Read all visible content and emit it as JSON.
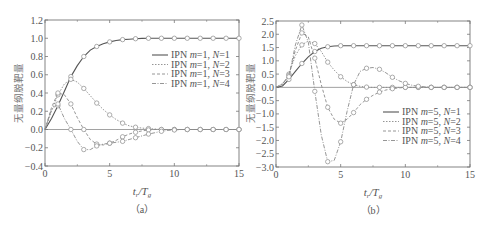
{
  "chart_data": [
    {
      "type": "line",
      "panel": "(a)",
      "caption": "（a）",
      "title": "",
      "xlabel": "t_r/T_g",
      "xlabel_main": "t",
      "xlabel_sub1": "r",
      "xlabel_main2": "/T",
      "xlabel_sub2": "g",
      "ylabel": "无量纲脱靶量",
      "xlim": [
        0,
        15
      ],
      "ylim": [
        -0.4,
        1.2
      ],
      "xticks": [
        0,
        5,
        10,
        15
      ],
      "yticks": [
        -0.4,
        -0.2,
        0.0,
        0.2,
        0.4,
        0.6,
        0.8,
        1.0,
        1.2
      ],
      "ytick_labels": [
        "−0.4",
        "−0.2",
        "0.0",
        "0.2",
        "0.4",
        "0.6",
        "0.8",
        "1.0",
        "1.2"
      ],
      "grid": false,
      "legend_position": "upper right",
      "x": [
        0,
        0.5,
        1,
        1.5,
        2,
        2.5,
        3,
        3.5,
        4,
        4.5,
        5,
        5.5,
        6,
        6.5,
        7,
        7.5,
        8,
        8.5,
        9,
        9.5,
        10,
        10.5,
        11,
        11.5,
        12,
        12.5,
        13,
        13.5,
        14,
        14.5,
        15
      ],
      "series": [
        {
          "name": "IPN m=1, N=1",
          "label_pre": "IPN",
          "m": "m",
          "m_val": "=1, ",
          "n": "N",
          "n_val": "=1",
          "style": "solid",
          "values": [
            0,
            0.12,
            0.26,
            0.42,
            0.58,
            0.7,
            0.8,
            0.87,
            0.91,
            0.94,
            0.96,
            0.975,
            0.985,
            0.99,
            0.995,
            0.998,
            1.0,
            1.0,
            1.0,
            1.0,
            1.0,
            1.0,
            1.0,
            1.0,
            1.0,
            1.0,
            1.0,
            1.0,
            1.0,
            1.0,
            1.0
          ]
        },
        {
          "name": "IPN m=1, N=2",
          "label_pre": "IPN",
          "m": "m",
          "m_val": "=1, ",
          "n": "N",
          "n_val": "=2",
          "style": "dotted",
          "values": [
            0,
            0.2,
            0.38,
            0.5,
            0.55,
            0.52,
            0.45,
            0.37,
            0.29,
            0.22,
            0.16,
            0.11,
            0.07,
            0.04,
            0.025,
            0.015,
            0.01,
            0.005,
            0.0,
            0.0,
            0.0,
            0.0,
            0.0,
            0.0,
            0.0,
            0.0,
            0.0,
            0.0,
            0.0,
            0.0,
            0.0
          ]
        },
        {
          "name": "IPN m=1, N=3",
          "label_pre": "IPN",
          "m": "m",
          "m_val": "=1, ",
          "n": "N",
          "n_val": "=3",
          "style": "dashed",
          "values": [
            0,
            0.24,
            0.4,
            0.38,
            0.28,
            0.13,
            0.0,
            -0.11,
            -0.16,
            -0.17,
            -0.15,
            -0.12,
            -0.08,
            -0.05,
            -0.03,
            -0.015,
            -0.005,
            0.0,
            0.0,
            0.0,
            0.0,
            0.0,
            0.0,
            0.0,
            0.0,
            0.0,
            0.0,
            0.0,
            0.0,
            0.0,
            0.0
          ]
        },
        {
          "name": "IPN m=1, N=4",
          "label_pre": "IPN",
          "m": "m",
          "m_val": "=1, ",
          "n": "N",
          "n_val": "=4",
          "style": "dashdot",
          "values": [
            0,
            0.22,
            0.28,
            0.12,
            0.0,
            -0.13,
            -0.22,
            -0.22,
            -0.18,
            -0.16,
            -0.15,
            -0.14,
            -0.13,
            -0.11,
            -0.09,
            -0.07,
            -0.05,
            -0.035,
            -0.02,
            -0.01,
            -0.005,
            0.0,
            0.0,
            0.0,
            0.0,
            0.0,
            0.0,
            0.0,
            0.0,
            0.0,
            0.0
          ]
        }
      ]
    },
    {
      "type": "line",
      "panel": "(b)",
      "caption": "（b）",
      "title": "",
      "xlabel": "t_r/T_g",
      "xlabel_main": "t",
      "xlabel_sub1": "r",
      "xlabel_main2": "/T",
      "xlabel_sub2": "g",
      "ylabel": "无量纲脱靶量",
      "xlim": [
        0,
        15
      ],
      "ylim": [
        -3.0,
        2.5
      ],
      "xticks": [
        0,
        5,
        10,
        15
      ],
      "yticks": [
        -3.0,
        -2.5,
        -2.0,
        -1.5,
        -1.0,
        -0.5,
        0.0,
        0.5,
        1.0,
        1.5,
        2.0,
        2.5
      ],
      "ytick_labels": [
        "−3.0",
        "−2.5",
        "−2.0",
        "−1.5",
        "−1.0",
        "−0.5",
        "0.0",
        "0.5",
        "1.0",
        "1.5",
        "2.0",
        "2.5"
      ],
      "grid": false,
      "legend_position": "lower right",
      "x": [
        0,
        0.5,
        1,
        1.5,
        2,
        2.5,
        3,
        3.5,
        4,
        4.5,
        5,
        5.5,
        6,
        6.5,
        7,
        7.5,
        8,
        8.5,
        9,
        9.5,
        10,
        10.5,
        11,
        11.5,
        12,
        12.5,
        13,
        13.5,
        14,
        14.5,
        15
      ],
      "series": [
        {
          "name": "IPN m=5, N=1",
          "label_pre": "IPN",
          "m": "m",
          "m_val": "=5, ",
          "n": "N",
          "n_val": "=1",
          "style": "solid",
          "values": [
            0,
            0.05,
            0.3,
            0.6,
            0.9,
            1.15,
            1.35,
            1.47,
            1.53,
            1.56,
            1.57,
            1.57,
            1.57,
            1.57,
            1.57,
            1.57,
            1.57,
            1.57,
            1.57,
            1.57,
            1.57,
            1.57,
            1.57,
            1.57,
            1.57,
            1.57,
            1.57,
            1.57,
            1.57,
            1.57,
            1.57
          ]
        },
        {
          "name": "IPN m=5, N=2",
          "label_pre": "IPN",
          "m": "m",
          "m_val": "=5, ",
          "n": "N",
          "n_val": "=2",
          "style": "dotted",
          "values": [
            0,
            0.1,
            0.5,
            1.2,
            1.6,
            1.75,
            1.65,
            1.35,
            0.95,
            0.65,
            0.4,
            0.22,
            0.1,
            0.04,
            0.01,
            0.0,
            0.0,
            0.0,
            0.0,
            0.0,
            0.0,
            0.0,
            0.0,
            0.0,
            0.0,
            0.0,
            0.0,
            0.0,
            0.0,
            0.0,
            0.0
          ]
        },
        {
          "name": "IPN m=5, N=3",
          "label_pre": "IPN",
          "m": "m",
          "m_val": "=5, ",
          "n": "N",
          "n_val": "=3",
          "style": "dashed",
          "values": [
            0,
            0.12,
            0.45,
            1.4,
            2.05,
            1.9,
            1.1,
            0.1,
            -0.75,
            -1.2,
            -1.35,
            -1.2,
            -0.95,
            -0.65,
            -0.45,
            -0.3,
            -0.18,
            -0.1,
            -0.05,
            -0.02,
            0.0,
            0.0,
            0.0,
            0.0,
            0.0,
            0.0,
            0.0,
            0.0,
            0.0,
            0.0,
            0.0
          ]
        },
        {
          "name": "IPN m=5, N=4",
          "label_pre": "IPN",
          "m": "m",
          "m_val": "=5, ",
          "n": "N",
          "n_val": "=4",
          "style": "dashdot",
          "values": [
            0,
            0.15,
            0.4,
            1.6,
            2.35,
            1.7,
            -0.15,
            -1.8,
            -2.8,
            -2.75,
            -2.05,
            -0.9,
            0.1,
            0.6,
            0.72,
            0.75,
            0.68,
            0.55,
            0.38,
            0.25,
            0.15,
            0.08,
            0.04,
            0.02,
            0.0,
            0.0,
            0.0,
            0.0,
            0.0,
            0.0,
            0.0
          ]
        }
      ]
    }
  ],
  "charts_meta": [
    {
      "frame": {
        "left": 45,
        "right": 239,
        "top": 20,
        "bottom": 166
      },
      "legend": {
        "x": 152,
        "y": 58,
        "dy": 9.5
      },
      "ylabel_pos": {
        "x": 22,
        "y": 93
      }
    },
    {
      "frame": {
        "left": 276,
        "right": 470,
        "top": 21,
        "bottom": 167
      },
      "legend": {
        "x": 383,
        "y": 115,
        "dy": 9.5
      },
      "ylabel_pos": {
        "x": 254,
        "y": 93
      }
    }
  ],
  "colors": {
    "axis": "#777777",
    "line": "#8a8a8a",
    "solid_line": "#555555",
    "text": "#555555"
  }
}
